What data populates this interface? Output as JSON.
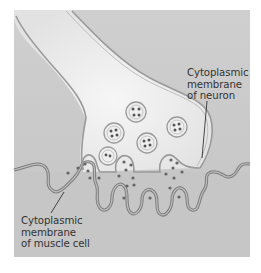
{
  "diagram": {
    "type": "neuromuscular-junction-illustration",
    "colors": {
      "background_panel": "#c9c9c9",
      "neuron_fill": "#ececec",
      "membrane_stroke": "#8a8a8a",
      "vesicle_dot": "#555555",
      "label_text": "#333333"
    },
    "labels": {
      "neuron_membrane": {
        "lines": [
          "Cytoplasmic",
          "membrane",
          "of neuron"
        ]
      },
      "muscle_membrane": {
        "lines": [
          "Cytoplasmic",
          "membrane",
          "of muscle cell"
        ]
      }
    },
    "vesicle_count": 5,
    "release_sites": 3
  }
}
